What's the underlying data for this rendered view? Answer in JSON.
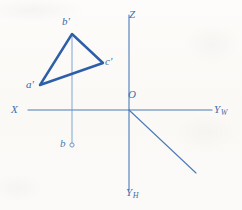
{
  "figure": {
    "colors": {
      "background": "#fbfaf7",
      "axis": "#4a7ab8",
      "triangle": "#2d5fa8",
      "label": "#3f6fae",
      "projector": "#6f9bd1"
    },
    "axes": [
      {
        "id": "x-axis",
        "label": "X",
        "sub": "",
        "label_x": 11,
        "label_y": 104
      },
      {
        "id": "yw-axis",
        "label": "Y",
        "sub": "W",
        "label_x": 214,
        "label_y": 104
      },
      {
        "id": "z-axis",
        "label": "Z",
        "sub": "",
        "label_x": 129,
        "label_y": 9
      },
      {
        "id": "yh-axis",
        "label": "Y",
        "sub": "H",
        "label_x": 126,
        "label_y": 187
      }
    ],
    "origin": {
      "label": "O",
      "x": 129,
      "y": 110,
      "label_x": 128,
      "label_y": 89
    },
    "triangle": {
      "name": "triangle-a-b-c-prime",
      "vertices": [
        {
          "id": "a-prime",
          "label": "a'",
          "x": 40,
          "y": 85,
          "label_x": 26,
          "label_y": 80
        },
        {
          "id": "b-prime",
          "label": "b'",
          "x": 72,
          "y": 34,
          "label_x": 62,
          "label_y": 16
        },
        {
          "id": "c-prime",
          "label": "c'",
          "x": 103,
          "y": 63,
          "label_x": 105,
          "label_y": 57
        }
      ]
    },
    "projection_point": {
      "id": "b-horizontal",
      "label": "b",
      "x": 72,
      "y": 145,
      "label_x": 60,
      "label_y": 138,
      "marker": "small-circle"
    },
    "projector_line": {
      "from_x": 72,
      "from_y": 34,
      "to_x": 72,
      "to_y": 145
    }
  }
}
